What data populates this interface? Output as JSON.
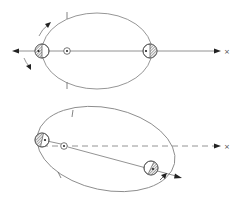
{
  "figure": {
    "panels": [
      {
        "id": "top",
        "line_style": "solid",
        "far_marker": "×",
        "bodies": [
          "perihelion-body",
          "aphelion-body"
        ],
        "focus_symbol": "star-dot"
      },
      {
        "id": "bottom",
        "line_style": "dashed",
        "far_marker": "×",
        "bodies": [
          "perihelion-body",
          "orbit-body"
        ],
        "focus_symbol": "star-dot"
      }
    ]
  },
  "labels": {
    "top_far_marker": "×",
    "bottom_far_marker": "×"
  },
  "colors": {
    "orbit": "#8a8a8a",
    "ink": "#222222",
    "hatch": "#555555",
    "background": "#ffffff"
  }
}
